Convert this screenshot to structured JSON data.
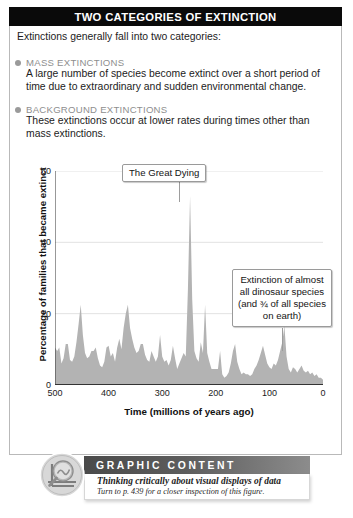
{
  "header": {
    "title": "TWO CATEGORIES OF EXTINCTION"
  },
  "intro": {
    "text": "Extinctions generally fall into two categories:"
  },
  "categories": [
    {
      "heading": "MASS EXTINCTIONS",
      "body": "A large number of species become extinct over a short period of time due to extraordinary and sudden environmental change."
    },
    {
      "heading": "BACKGROUND EXTINCTIONS",
      "body": "These extinctions occur at lower rates during times other than mass extinctions."
    }
  ],
  "callouts": {
    "great_dying": "The Great Dying",
    "dinosaur": "Extinction of almost all dinosaur species (and ¾ of all species on earth)"
  },
  "graphic_content": {
    "banner": "GRAPHIC CONTENT",
    "line1": "Thinking critically about visual displays of data",
    "line2": "Turn to p. 439 for a closer inspection of this figure."
  },
  "colors": {
    "title_bar": "#0a0a0a",
    "heading_gray": "#8e8e8e",
    "area_fill": "#b3b3b3",
    "gridline": "#e2e2e2",
    "axis": "#333333"
  },
  "chart_data": {
    "type": "area",
    "title": "",
    "xlabel": "Time  (millions of years ago)",
    "ylabel": "Percentage of families that became extinct",
    "xlim": [
      500,
      0
    ],
    "ylim": [
      0,
      60
    ],
    "xticks": [
      500,
      400,
      300,
      200,
      100,
      0
    ],
    "yticks": [
      0,
      20,
      40,
      60
    ],
    "x_reversed": true,
    "grid": "horizontal",
    "legend": "none",
    "annotations": [
      {
        "label": "The Great Dying",
        "x": 251,
        "y": 53
      },
      {
        "label": "Extinction of almost all dinosaur species (and ¾ of all species on earth)",
        "x": 66,
        "y": 17
      }
    ],
    "x": [
      500,
      496,
      492,
      488,
      484,
      480,
      476,
      472,
      468,
      464,
      460,
      456,
      452,
      448,
      444,
      440,
      436,
      432,
      428,
      424,
      420,
      416,
      412,
      408,
      404,
      400,
      396,
      392,
      388,
      384,
      380,
      376,
      372,
      368,
      364,
      360,
      356,
      352,
      348,
      344,
      340,
      336,
      332,
      328,
      324,
      320,
      316,
      312,
      308,
      304,
      300,
      296,
      292,
      288,
      284,
      280,
      276,
      272,
      268,
      264,
      260,
      256,
      252,
      248,
      244,
      240,
      236,
      232,
      228,
      224,
      220,
      216,
      212,
      208,
      204,
      200,
      196,
      192,
      188,
      184,
      180,
      176,
      172,
      168,
      164,
      160,
      156,
      152,
      148,
      144,
      140,
      136,
      132,
      128,
      124,
      120,
      116,
      112,
      108,
      104,
      100,
      96,
      92,
      88,
      84,
      80,
      76,
      72,
      68,
      64,
      60,
      56,
      52,
      48,
      44,
      40,
      36,
      32,
      28,
      24,
      20,
      16,
      12,
      8,
      4,
      0
    ],
    "values": [
      10.5,
      9.5,
      10.5,
      6.0,
      7.5,
      11.5,
      11.5,
      7.0,
      6.5,
      8.0,
      12.0,
      17.0,
      22.5,
      14.0,
      9.0,
      7.5,
      8.0,
      9.5,
      9.5,
      10.5,
      7.5,
      5.5,
      5.0,
      6.5,
      10.5,
      11.0,
      8.0,
      9.0,
      6.5,
      10.5,
      13.0,
      10.0,
      16.0,
      20.0,
      22.5,
      16.0,
      13.0,
      10.5,
      9.0,
      9.5,
      11.5,
      11.5,
      8.5,
      7.0,
      6.5,
      9.5,
      8.0,
      6.5,
      8.0,
      14.0,
      8.0,
      6.5,
      7.0,
      5.5,
      7.0,
      11.0,
      7.5,
      4.5,
      6.0,
      7.5,
      9.0,
      8.0,
      27.0,
      53.0,
      24.0,
      9.5,
      7.5,
      6.5,
      12.0,
      9.0,
      22.5,
      9.0,
      6.5,
      4.5,
      4.5,
      4.5,
      4.5,
      9.5,
      3.0,
      2.0,
      2.5,
      3.5,
      6.0,
      9.5,
      11.5,
      6.5,
      4.5,
      3.0,
      3.5,
      3.0,
      3.0,
      2.5,
      3.0,
      4.5,
      5.5,
      7.0,
      9.0,
      11.0,
      8.5,
      6.0,
      5.0,
      4.5,
      6.0,
      5.5,
      7.0,
      9.5,
      12.0,
      16.5,
      8.0,
      4.5,
      3.5,
      5.0,
      4.5,
      3.5,
      4.5,
      5.5,
      4.0,
      3.5,
      4.0,
      3.0,
      3.5,
      2.5,
      3.0,
      2.0,
      2.0,
      1.5
    ]
  }
}
